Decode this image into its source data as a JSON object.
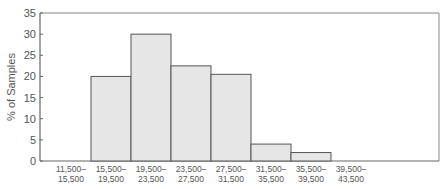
{
  "chart_data": {
    "type": "bar",
    "title": "",
    "xlabel": "",
    "ylabel": "% of Samples",
    "ylim": [
      0,
      35
    ],
    "yticks": [
      0,
      5,
      10,
      15,
      20,
      25,
      30,
      35
    ],
    "grid": false,
    "legend": null,
    "categories": [
      [
        "11,500–",
        "15,500"
      ],
      [
        "15,500–",
        "19,500"
      ],
      [
        "19,500–",
        "23,500"
      ],
      [
        "23,500–",
        "27,500"
      ],
      [
        "27,500–",
        "31,500"
      ],
      [
        "31,500–",
        "35,500"
      ],
      [
        "35,500–",
        "39,500"
      ],
      [
        "39,500–",
        "43,500"
      ]
    ],
    "values": [
      0,
      20,
      30,
      22.5,
      20.5,
      4,
      2,
      0
    ],
    "colors": {
      "bar_fill": "#e6e6e6",
      "bar_stroke": "#555555",
      "axis": "#666666",
      "frame": "#888888"
    }
  }
}
